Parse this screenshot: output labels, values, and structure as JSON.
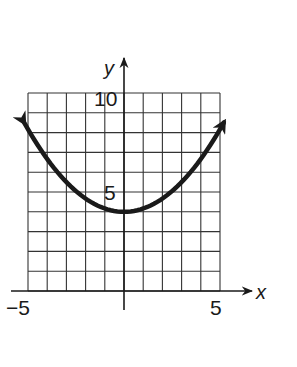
{
  "chart_data": {
    "type": "line",
    "title": "",
    "xlabel": "x",
    "ylabel": "y",
    "xlim": [
      -5,
      5
    ],
    "ylim": [
      0,
      10
    ],
    "grid": true,
    "grid_step": 1,
    "x_tick_labels": [
      {
        "value": -5,
        "label": "−5"
      },
      {
        "value": 5,
        "label": "5"
      }
    ],
    "y_tick_labels": [
      {
        "value": 5,
        "label": "5"
      },
      {
        "value": 10,
        "label": "10"
      }
    ],
    "series": [
      {
        "name": "parabola",
        "description": "upward-opening parabola with vertex (0, 4), arrows at both ends",
        "vertex": [
          0,
          4
        ],
        "equation_estimate": "y = x^2/6 + 4",
        "x": [
          -5.2,
          -5,
          -4,
          -3,
          -2,
          -1,
          0,
          1,
          2,
          3,
          4,
          5,
          5.2
        ],
        "values": [
          8.5,
          8.17,
          6.67,
          5.5,
          4.67,
          4.17,
          4,
          4.17,
          4.67,
          5.5,
          6.67,
          8.17,
          8.5
        ],
        "arrows": "both"
      }
    ],
    "legend": null
  },
  "colors": {
    "ink": "#1a1a1a",
    "grid": "#333333",
    "background": "#ffffff"
  }
}
